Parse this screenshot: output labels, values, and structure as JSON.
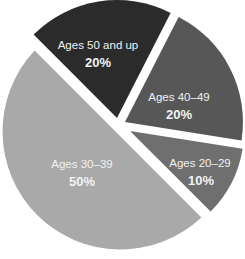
{
  "chart_data": {
    "type": "pie",
    "title": "",
    "exploded": true,
    "categories": [
      "Ages 50 and up",
      "Ages 40–49",
      "Ages 20–29",
      "Ages 30–39"
    ],
    "values": [
      20,
      20,
      10,
      50
    ],
    "unit": "%",
    "colors": [
      "#2b2b2b",
      "#575757",
      "#6f6f6f",
      "#a9a9a9"
    ],
    "slices": [
      {
        "label": "Ages 50 and up",
        "value": 20,
        "display": "20%",
        "color": "#2b2b2b"
      },
      {
        "label": "Ages 40–49",
        "value": 20,
        "display": "20%",
        "color": "#575757"
      },
      {
        "label": "Ages 20–29",
        "value": 10,
        "display": "10%",
        "color": "#6f6f6f"
      },
      {
        "label": "Ages 30–39",
        "value": 50,
        "display": "50%",
        "color": "#a9a9a9"
      }
    ],
    "legend": "none (labels inside slices)"
  }
}
